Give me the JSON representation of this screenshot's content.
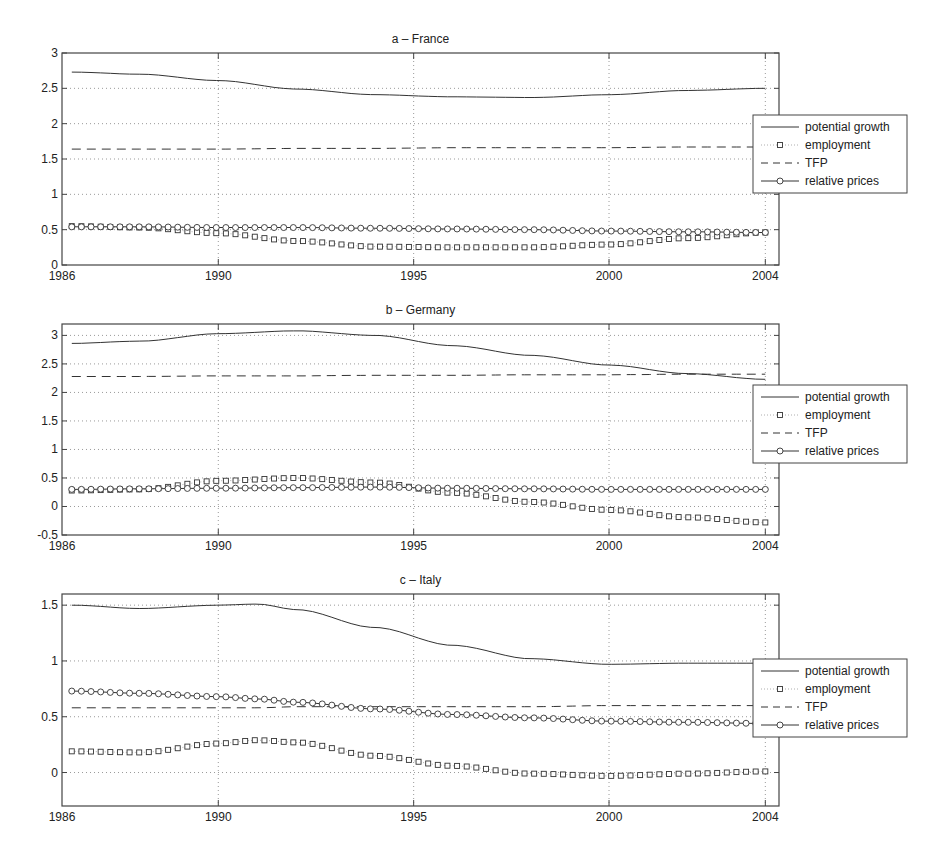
{
  "figure": {
    "x_ticks": [
      "1986",
      "1990",
      "1995",
      "2000",
      "2004"
    ],
    "legend": [
      {
        "label": "potential growth",
        "style": "solid"
      },
      {
        "label": "employment",
        "style": "dotted-square"
      },
      {
        "label": "TFP",
        "style": "dashed"
      },
      {
        "label": "relative prices",
        "style": "solid-circle"
      }
    ],
    "colors": {
      "line": "#333333",
      "grid": "#9a9a9a",
      "axis": "#444444",
      "background": "#ffffff"
    }
  },
  "chart_data": [
    {
      "type": "line",
      "title": "a – France",
      "xlabel": "",
      "ylabel": "",
      "xlim": [
        1986,
        2004
      ],
      "ylim": [
        0,
        3
      ],
      "y_ticks": [
        "0",
        "0.5",
        "1",
        "1.5",
        "2",
        "2.5",
        "3"
      ],
      "x_ticks": [
        "1986",
        "1990",
        "1995",
        "2000",
        "2004"
      ],
      "grid": true,
      "legend_position": "outside right",
      "x": [
        1986.25,
        1988,
        1990,
        1992,
        1994,
        1996,
        1998,
        2000,
        2002,
        2004
      ],
      "series": [
        {
          "name": "potential growth",
          "values": [
            2.73,
            2.7,
            2.61,
            2.49,
            2.41,
            2.38,
            2.37,
            2.41,
            2.47,
            2.5
          ]
        },
        {
          "name": "employment",
          "values": [
            0.55,
            0.53,
            0.45,
            0.34,
            0.26,
            0.25,
            0.25,
            0.29,
            0.38,
            0.46
          ]
        },
        {
          "name": "TFP",
          "values": [
            1.64,
            1.64,
            1.64,
            1.65,
            1.65,
            1.66,
            1.66,
            1.66,
            1.67,
            1.67
          ]
        },
        {
          "name": "relative prices",
          "values": [
            0.54,
            0.54,
            0.53,
            0.53,
            0.52,
            0.51,
            0.5,
            0.48,
            0.47,
            0.46
          ]
        }
      ]
    },
    {
      "type": "line",
      "title": "b – Germany",
      "xlabel": "",
      "ylabel": "",
      "xlim": [
        1986,
        2004
      ],
      "ylim": [
        -0.5,
        3.2
      ],
      "y_ticks": [
        "-0.5",
        "0",
        "0.5",
        "1",
        "1.5",
        "2",
        "2.5",
        "3"
      ],
      "x_ticks": [
        "1986",
        "1990",
        "1995",
        "2000",
        "2004"
      ],
      "grid": true,
      "legend_position": "outside right",
      "x": [
        1986.25,
        1988,
        1990,
        1992,
        1994,
        1996,
        1998,
        2000,
        2002,
        2004
      ],
      "series": [
        {
          "name": "potential growth",
          "values": [
            2.86,
            2.9,
            3.03,
            3.08,
            3.0,
            2.82,
            2.65,
            2.48,
            2.33,
            2.23
          ]
        },
        {
          "name": "employment",
          "values": [
            0.28,
            0.3,
            0.45,
            0.5,
            0.42,
            0.24,
            0.08,
            -0.06,
            -0.19,
            -0.28
          ]
        },
        {
          "name": "TFP",
          "values": [
            2.28,
            2.28,
            2.29,
            2.29,
            2.3,
            2.3,
            2.31,
            2.31,
            2.32,
            2.32
          ]
        },
        {
          "name": "relative prices",
          "values": [
            0.3,
            0.31,
            0.32,
            0.33,
            0.34,
            0.32,
            0.31,
            0.3,
            0.3,
            0.3
          ]
        }
      ]
    },
    {
      "type": "line",
      "title": "c – Italy",
      "xlabel": "",
      "ylabel": "",
      "xlim": [
        1986,
        2004
      ],
      "ylim": [
        -0.3,
        1.6
      ],
      "y_ticks": [
        "0",
        "0.5",
        "1",
        "1.5"
      ],
      "x_ticks": [
        "1986",
        "1990",
        "1995",
        "2000",
        "2004"
      ],
      "grid": true,
      "legend_position": "outside right",
      "x": [
        1986.25,
        1988,
        1990,
        1991,
        1992,
        1994,
        1996,
        1998,
        2000,
        2002,
        2004
      ],
      "series": [
        {
          "name": "potential growth",
          "values": [
            1.5,
            1.47,
            1.5,
            1.51,
            1.46,
            1.3,
            1.14,
            1.02,
            0.97,
            0.98,
            0.98
          ]
        },
        {
          "name": "employment",
          "values": [
            0.19,
            0.18,
            0.26,
            0.29,
            0.27,
            0.15,
            0.06,
            -0.01,
            -0.03,
            -0.01,
            0.01
          ]
        },
        {
          "name": "TFP",
          "values": [
            0.58,
            0.58,
            0.58,
            0.58,
            0.59,
            0.59,
            0.59,
            0.59,
            0.6,
            0.6,
            0.6
          ]
        },
        {
          "name": "relative prices",
          "values": [
            0.73,
            0.71,
            0.68,
            0.66,
            0.63,
            0.57,
            0.52,
            0.49,
            0.46,
            0.45,
            0.44
          ]
        }
      ]
    }
  ]
}
